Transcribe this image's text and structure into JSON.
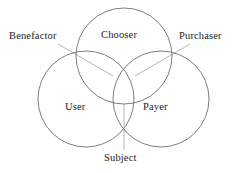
{
  "diagram": {
    "type": "venn",
    "background_color": "#ffffff",
    "circle_stroke_color": "#6e6e6e",
    "leader_line_color": "#b0b0b0",
    "text_color": "#1c1c1c",
    "sets": [
      {
        "id": "chooser",
        "label": "Chooser",
        "position": "top",
        "center": {
          "x": 124,
          "y": 56
        },
        "radius": 48
      },
      {
        "id": "user",
        "label": "User",
        "position": "bottom-left",
        "center": {
          "x": 86,
          "y": 99
        },
        "radius": 48
      },
      {
        "id": "payer",
        "label": "Payer",
        "position": "bottom-right",
        "center": {
          "x": 161,
          "y": 99
        },
        "radius": 48
      }
    ],
    "callouts": [
      {
        "id": "benefactor",
        "label": "Benefactor",
        "describes": "chooser-and-user-intersection",
        "anchor": {
          "x": 78,
          "y": 55
        },
        "leader": {
          "x1": 58,
          "y1": 44,
          "x2": 113,
          "y2": 76
        }
      },
      {
        "id": "purchaser",
        "label": "Purchaser",
        "describes": "chooser-and-payer-intersection",
        "anchor": {
          "x": 169,
          "y": 55
        },
        "leader": {
          "x1": 190,
          "y1": 44,
          "x2": 135,
          "y2": 76
        }
      },
      {
        "id": "subject",
        "label": "Subject",
        "describes": "user-and-payer-intersection",
        "anchor": {
          "x": 124,
          "y": 130
        },
        "leader": {
          "x1": 124,
          "y1": 104,
          "x2": 124,
          "y2": 150
        }
      }
    ]
  }
}
